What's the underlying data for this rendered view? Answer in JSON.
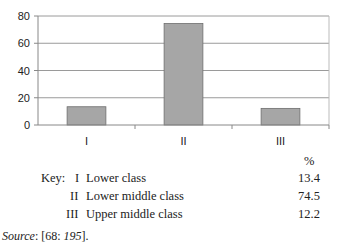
{
  "chart_data": {
    "type": "bar",
    "title": "",
    "xlabel": "",
    "ylabel": "",
    "categories": [
      "I",
      "II",
      "III"
    ],
    "values": [
      13.4,
      74.5,
      12.2
    ],
    "ylim": [
      0,
      80
    ],
    "yticks": [
      0,
      20,
      40,
      60,
      80
    ],
    "grid": true,
    "legend": "none",
    "bar_color": "#a6a6a6"
  },
  "key": {
    "unit_header": "%",
    "prefix": "Key:",
    "rows": [
      {
        "code": "I",
        "label": "Lower class",
        "value": "13.4"
      },
      {
        "code": "II",
        "label": "Lower middle class",
        "value": "74.5"
      },
      {
        "code": "III",
        "label": "Upper middle class",
        "value": "12.2"
      }
    ]
  },
  "source": {
    "label": "Source",
    "text_a": ": [68: ",
    "page": "195",
    "text_b": "]."
  }
}
